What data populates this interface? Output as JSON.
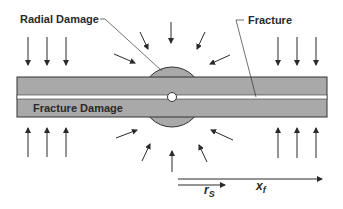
{
  "diagram": {
    "labels": {
      "radial_damage": "Radial Damage",
      "fracture": "Fracture",
      "fracture_damage": "Fracture Damage",
      "rs_main": "r",
      "rs_sub": "S",
      "xf_main": "x",
      "xf_sub": "f"
    },
    "colors": {
      "slab_fill": "#a9a9a9",
      "outline": "#333333",
      "fracture_line": "#ffffff",
      "background": "#ffffff"
    },
    "elements": {
      "slab": "horizontal damaged slab",
      "radial_zone": "circular radial damage zone",
      "borehole": "small white circle at center",
      "compression_arrows_top": 6,
      "compression_arrows_bottom": 6,
      "radial_arrows": 10
    }
  }
}
